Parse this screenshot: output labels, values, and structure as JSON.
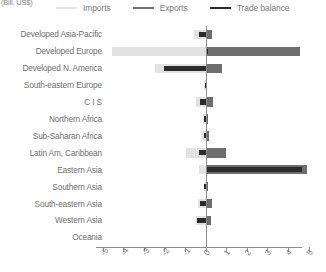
{
  "units_label": "(Bill. US$)",
  "legend": {
    "items": [
      {
        "label": "Imports",
        "color": "#e2e2e2",
        "key": "imports"
      },
      {
        "label": "Exports",
        "color": "#6e6e6e",
        "key": "exports"
      },
      {
        "label": "Trade balance",
        "color": "#2b2b2b",
        "key": "balance"
      }
    ]
  },
  "chart_data": {
    "type": "bar",
    "orientation": "horizontal",
    "title": "",
    "subtitle": "",
    "xlabel": "(Bill. US$)",
    "ylabel": "",
    "xlim": [
      -5,
      5
    ],
    "xticks": [
      -5,
      -4,
      -3,
      -2,
      -1,
      0,
      1,
      2,
      3,
      4,
      5
    ],
    "xticklabels": [
      "-5",
      "-4",
      "-3",
      "-2",
      "-1",
      "0",
      "1",
      "2",
      "3",
      "4",
      "5"
    ],
    "grid": false,
    "legend_position": "top",
    "zero_reference_line": true,
    "categories": [
      "Developed Asia-Pacific",
      "Developed Europe",
      "Developed N. America",
      "South-eastern Europe",
      "C I S",
      "Northern Africa",
      "Sub-Saharan Africa",
      "Latin Am, Caribbean",
      "Eastern Asia",
      "Southern Asia",
      "South-eastern Asia",
      "Western Asia",
      "Oceania"
    ],
    "series": [
      {
        "name": "Imports",
        "color": "#e2e2e2",
        "note": "plotted as negative magnitudes",
        "values": [
          -0.55,
          -4.55,
          -2.45,
          -0.1,
          -0.45,
          -0.12,
          -0.2,
          -0.95,
          -0.3,
          -0.1,
          -0.35,
          -0.45,
          0.0
        ]
      },
      {
        "name": "Exports",
        "color": "#6e6e6e",
        "values": [
          0.3,
          4.6,
          0.8,
          0.08,
          0.35,
          0.1,
          0.15,
          1.0,
          4.9,
          0.12,
          0.3,
          0.25,
          0.0
        ]
      },
      {
        "name": "Trade balance",
        "color": "#2b2b2b",
        "values": [
          -0.3,
          0.1,
          -2.0,
          -0.05,
          -0.25,
          -0.08,
          -0.1,
          -0.3,
          4.7,
          -0.08,
          -0.25,
          -0.4,
          0.0
        ]
      }
    ]
  }
}
